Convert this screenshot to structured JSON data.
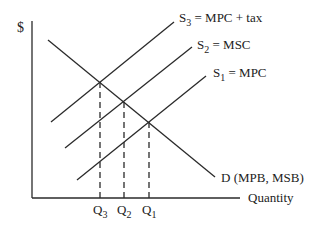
{
  "diagram": {
    "y_axis_label": "$",
    "x_axis_label": "Quantity",
    "curves": [
      {
        "id": "S3",
        "label_main": "S",
        "label_sub": "3",
        "label_rest": " = MPC + tax"
      },
      {
        "id": "S2",
        "label_main": "S",
        "label_sub": "2",
        "label_rest": " = MSC"
      },
      {
        "id": "S1",
        "label_main": "S",
        "label_sub": "1",
        "label_rest": " = MPC"
      },
      {
        "id": "D",
        "label": "D (MPB, MSB)"
      }
    ],
    "quantities": [
      {
        "main": "Q",
        "sub": "3"
      },
      {
        "main": "Q",
        "sub": "2"
      },
      {
        "main": "Q",
        "sub": "1"
      }
    ],
    "line_color": "#2a2a2a"
  }
}
